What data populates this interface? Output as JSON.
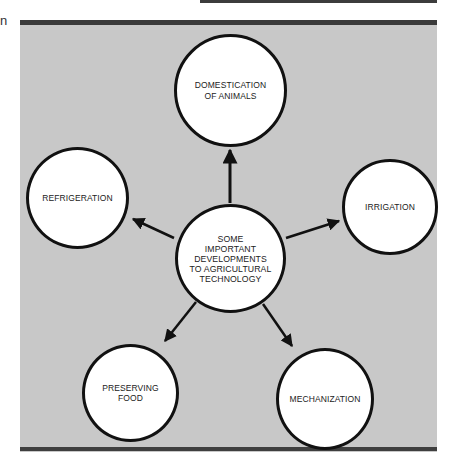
{
  "margin_text": "n",
  "diagram": {
    "title": "Some important developments to agricultural technology",
    "colors": {
      "panel_background": "#c8c8c8",
      "panel_border": "#3a3a3a",
      "node_fill": "#ffffff",
      "node_stroke": "#111111",
      "arrow": "#111111"
    },
    "center": {
      "label": "SOME\nIMPORTANT\nDEVELOPMENTS\nTO AGRICULTURAL\nTECHNOLOGY"
    },
    "nodes": [
      {
        "id": "domestication",
        "label": "DOMESTICATION\nOF ANIMALS"
      },
      {
        "id": "irrigation",
        "label": "IRRIGATION"
      },
      {
        "id": "mechanization",
        "label": "MECHANIZATION"
      },
      {
        "id": "preserving-food",
        "label": "PRESERVING\nFOOD"
      },
      {
        "id": "refrigeration",
        "label": "REFRIGERATION"
      }
    ],
    "edges": [
      {
        "from": "center",
        "to": "domestication"
      },
      {
        "from": "center",
        "to": "irrigation"
      },
      {
        "from": "center",
        "to": "mechanization"
      },
      {
        "from": "center",
        "to": "preserving-food"
      },
      {
        "from": "center",
        "to": "refrigeration"
      }
    ]
  }
}
